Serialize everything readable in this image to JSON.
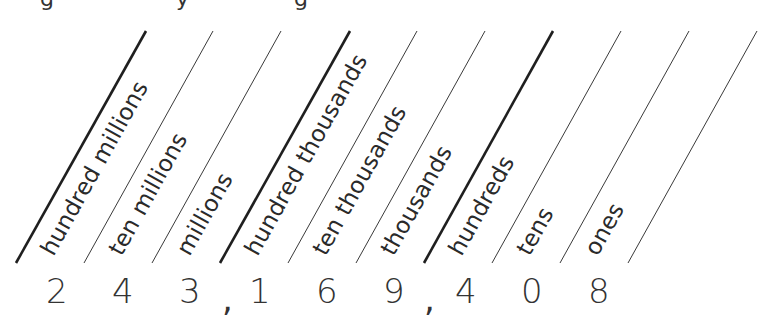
{
  "place_value_chart": {
    "labels": [
      "hundred millions",
      "ten millions",
      "millions",
      "hundred thousands",
      "ten thousands",
      "thousands",
      "hundreds",
      "tens",
      "ones"
    ],
    "digits": [
      "2",
      "4",
      "3",
      "1",
      "6",
      "9",
      "4",
      "0",
      "8"
    ],
    "separator": ",",
    "number": "243,169,408",
    "line_color": "#222222",
    "thick_lines_before": [
      "hundred millions",
      "hundred thousands",
      "hundreds"
    ]
  },
  "clipped_heading_fragments": [
    "g",
    "y",
    "g"
  ]
}
